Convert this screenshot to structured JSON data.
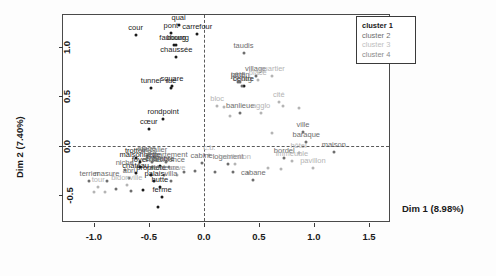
{
  "chart_data": {
    "type": "scatter",
    "title": "",
    "xlabel": "Dim 1 (8.98%)",
    "ylabel": "Dim 2 (7.40%)",
    "xlim": [
      -1.28,
      1.7
    ],
    "ylim": [
      -0.78,
      1.32
    ],
    "xticks": [
      "-1.0",
      "-0.5",
      "0.0",
      "0.5",
      "1.0",
      "1.5"
    ],
    "xtickvals": [
      -1.0,
      -0.5,
      0.0,
      0.5,
      1.0,
      1.5
    ],
    "yticks": [
      "1.0",
      "0.5",
      "0.0",
      "-0.5"
    ],
    "ytickvals": [
      1.0,
      0.5,
      0.0,
      -0.5
    ],
    "grid": false,
    "reference_lines": {
      "x": 0.0,
      "y": 0.0,
      "style": "dashed"
    },
    "legend_position": "top-right",
    "cluster_colors": [
      "#1a1a1a",
      "#6e6e6e",
      "#b4b4b4",
      "#8c8c8c"
    ],
    "points": [
      {
        "label": "cour",
        "x": -0.62,
        "y": 1.12,
        "cluster": 1
      },
      {
        "label": "pont",
        "x": -0.3,
        "y": 1.14,
        "cluster": 1
      },
      {
        "label": "quai",
        "x": -0.23,
        "y": 1.22,
        "cluster": 1
      },
      {
        "label": "carrefour",
        "x": -0.06,
        "y": 1.13,
        "cluster": 1
      },
      {
        "label": "faubourg",
        "x": -0.27,
        "y": 1.02,
        "cluster": 1
      },
      {
        "label": "bourg",
        "x": -0.25,
        "y": 1.02,
        "cluster": 1
      },
      {
        "label": "chaussée",
        "x": -0.25,
        "y": 0.9,
        "cluster": 1
      },
      {
        "label": "tunnel",
        "x": -0.48,
        "y": 0.58,
        "cluster": 1
      },
      {
        "label": "square",
        "x": -0.29,
        "y": 0.6,
        "cluster": 1
      },
      {
        "label": "rue",
        "x": -0.3,
        "y": 0.58,
        "cluster": 1
      },
      {
        "label": "rondpoint",
        "x": -0.37,
        "y": 0.27,
        "cluster": 1
      },
      {
        "label": "cœur",
        "x": -0.5,
        "y": 0.17,
        "cluster": 1
      },
      {
        "label": "taudis",
        "x": 0.36,
        "y": 0.94,
        "cluster": 2
      },
      {
        "label": "village",
        "x": 0.47,
        "y": 0.7,
        "cluster": 2
      },
      {
        "label": "quartier",
        "x": 0.62,
        "y": 0.7,
        "cluster": 3
      },
      {
        "label": "place",
        "x": 0.49,
        "y": 0.66,
        "cluster": 3
      },
      {
        "label": "jardin",
        "x": 0.33,
        "y": 0.64,
        "cluster": 2
      },
      {
        "label": "pâté",
        "x": 0.31,
        "y": 0.64,
        "cluster": 2
      },
      {
        "label": "centre",
        "x": 0.36,
        "y": 0.6,
        "cluster": 1
      },
      {
        "label": "bourg",
        "x": 0.35,
        "y": 0.6,
        "cluster": 2
      },
      {
        "label": "cité",
        "x": 0.68,
        "y": 0.44,
        "cluster": 3
      },
      {
        "label": "bloc",
        "x": 0.12,
        "y": 0.4,
        "cluster": 3
      },
      {
        "label": "banlieue",
        "x": 0.33,
        "y": 0.33,
        "cluster": 2
      },
      {
        "label": "agglo",
        "x": 0.52,
        "y": 0.33,
        "cluster": 3
      },
      {
        "label": "ville",
        "x": 0.9,
        "y": 0.14,
        "cluster": 2
      },
      {
        "label": "baraque",
        "x": 0.93,
        "y": 0.04,
        "cluster": 2
      },
      {
        "label": "hôtel",
        "x": 0.86,
        "y": -0.07,
        "cluster": 3
      },
      {
        "label": "maison",
        "x": 1.18,
        "y": -0.06,
        "cluster": 2
      },
      {
        "label": "pavillon",
        "x": 0.99,
        "y": -0.22,
        "cluster": 3
      },
      {
        "label": "bordel",
        "x": 0.73,
        "y": -0.12,
        "cluster": 2
      },
      {
        "label": "immeuble",
        "x": 0.8,
        "y": -0.15,
        "cluster": 3
      },
      {
        "label": "cabane",
        "x": 0.45,
        "y": -0.35,
        "cluster": 2
      },
      {
        "label": "logement",
        "x": 0.22,
        "y": -0.18,
        "cluster": 2
      },
      {
        "label": "habitation",
        "x": 0.28,
        "y": -0.18,
        "cluster": 3
      },
      {
        "label": "cabine",
        "x": -0.02,
        "y": -0.17,
        "cluster": 2
      },
      {
        "label": "chambre",
        "x": -0.4,
        "y": -0.2,
        "cluster": 1
      },
      {
        "label": "trottoir",
        "x": -0.62,
        "y": -0.12,
        "cluster": 1
      },
      {
        "label": "étage",
        "x": -0.52,
        "y": -0.1,
        "cluster": 2
      },
      {
        "label": "escalier",
        "x": -0.45,
        "y": -0.11,
        "cluster": 2
      },
      {
        "label": "maisonnette",
        "x": -0.58,
        "y": -0.16,
        "cluster": 1
      },
      {
        "label": "toit",
        "x": -0.47,
        "y": -0.16,
        "cluster": 2
      },
      {
        "label": "appartement",
        "x": -0.34,
        "y": -0.16,
        "cluster": 2
      },
      {
        "label": "foyer",
        "x": -0.58,
        "y": -0.21,
        "cluster": 1
      },
      {
        "label": "chalet",
        "x": -0.47,
        "y": -0.21,
        "cluster": 2
      },
      {
        "label": "résidence",
        "x": -0.32,
        "y": -0.21,
        "cluster": 2
      },
      {
        "label": "propriété",
        "x": -0.48,
        "y": -0.3,
        "cluster": 1
      },
      {
        "label": "demeure",
        "x": -0.36,
        "y": -0.3,
        "cluster": 2
      },
      {
        "label": "cave",
        "x": -0.24,
        "y": -0.3,
        "cluster": 3
      },
      {
        "label": "palais",
        "x": -0.45,
        "y": -0.36,
        "cluster": 1
      },
      {
        "label": "villa",
        "x": -0.3,
        "y": -0.36,
        "cluster": 2
      },
      {
        "label": "hutte",
        "x": -0.4,
        "y": -0.42,
        "cluster": 1
      },
      {
        "label": "ferme",
        "x": -0.38,
        "y": -0.52,
        "cluster": 1
      },
      {
        "label": "château",
        "x": -0.62,
        "y": -0.28,
        "cluster": 1
      },
      {
        "label": "c.b.",
        "x": 0.05,
        "y": -0.09,
        "cluster": 3
      },
      {
        "label": "niche",
        "x": -0.72,
        "y": -0.24,
        "cluster": 2
      },
      {
        "label": "abri",
        "x": -0.68,
        "y": -0.33,
        "cluster": 2
      },
      {
        "label": "bidonville",
        "x": -0.7,
        "y": -0.4,
        "cluster": 3
      },
      {
        "label": "masure",
        "x": -0.88,
        "y": -0.36,
        "cluster": 2
      },
      {
        "label": "tour",
        "x": -0.96,
        "y": -0.42,
        "cluster": 3
      },
      {
        "label": "terrier",
        "x": -1.04,
        "y": -0.36,
        "cluster": 2
      },
      {
        "label": "",
        "x": 0.62,
        "y": 0.13,
        "cluster": 3
      },
      {
        "label": "",
        "x": 0.72,
        "y": 0.4,
        "cluster": 3
      },
      {
        "label": "",
        "x": 0.18,
        "y": 0.39,
        "cluster": 3
      },
      {
        "label": "",
        "x": 0.4,
        "y": -0.28,
        "cluster": 3
      },
      {
        "label": "",
        "x": 0.58,
        "y": -0.22,
        "cluster": 3
      },
      {
        "label": "",
        "x": 0.7,
        "y": -0.23,
        "cluster": 3
      },
      {
        "label": "",
        "x": 0.26,
        "y": -0.27,
        "cluster": 2
      },
      {
        "label": "",
        "x": 0.1,
        "y": -0.27,
        "cluster": 2
      },
      {
        "label": "",
        "x": -0.08,
        "y": -0.26,
        "cluster": 2
      },
      {
        "label": "",
        "x": -0.18,
        "y": -0.27,
        "cluster": 2
      },
      {
        "label": "",
        "x": -0.55,
        "y": -0.45,
        "cluster": 1
      },
      {
        "label": "",
        "x": -0.66,
        "y": -0.46,
        "cluster": 2
      },
      {
        "label": "",
        "x": -0.8,
        "y": -0.44,
        "cluster": 2
      },
      {
        "label": "",
        "x": -0.9,
        "y": -0.47,
        "cluster": 3
      },
      {
        "label": "",
        "x": -1.0,
        "y": -0.47,
        "cluster": 3
      },
      {
        "label": "",
        "x": -0.42,
        "y": -0.62,
        "cluster": 1
      },
      {
        "label": "",
        "x": 0.86,
        "y": 0.38,
        "cluster": 3
      },
      {
        "label": "",
        "x": 0.24,
        "y": 0.3,
        "cluster": 3
      }
    ]
  },
  "legend": {
    "items": [
      {
        "label": "cluster 1",
        "color": "#1a1a1a"
      },
      {
        "label": "cluster 2",
        "color": "#6e6e6e"
      },
      {
        "label": "cluster 3",
        "color": "#c0c0c0"
      },
      {
        "label": "cluster 4",
        "color": "#8c8c8c"
      }
    ]
  }
}
